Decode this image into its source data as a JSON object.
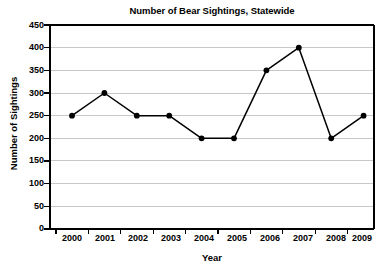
{
  "chart_data": {
    "type": "line",
    "title": "Number of Bear Sightings, Statewide",
    "xlabel": "Year",
    "ylabel": "Number of Sightings",
    "categories": [
      "2000",
      "2001",
      "2002",
      "2003",
      "2004",
      "2005",
      "2006",
      "2007",
      "2008",
      "2009"
    ],
    "values": [
      250,
      300,
      250,
      250,
      200,
      200,
      350,
      400,
      200,
      250
    ],
    "series": [
      {
        "name": "Bear Sightings",
        "values": [
          250,
          300,
          250,
          250,
          200,
          200,
          350,
          400,
          200,
          250
        ]
      }
    ],
    "points": [
      {
        "x": "2000",
        "y": 250
      },
      {
        "x": "2001",
        "y": 300
      },
      {
        "x": "2002",
        "y": 250
      },
      {
        "x": "2003",
        "y": 250
      },
      {
        "x": "2004",
        "y": 200
      },
      {
        "x": "2005",
        "y": 200
      },
      {
        "x": "2006",
        "y": 350
      },
      {
        "x": "2007",
        "y": 400
      },
      {
        "x": "2008",
        "y": 200
      },
      {
        "x": "2009",
        "y": 250
      }
    ],
    "ylim": [
      0,
      450
    ],
    "ytick_step": 50,
    "yticks": [
      0,
      50,
      100,
      150,
      200,
      250,
      300,
      350,
      400,
      450
    ],
    "ytick_labels": [
      "0",
      "50",
      "100",
      "150",
      "200",
      "250",
      "300",
      "350",
      "400",
      "450"
    ],
    "xtick_labels": [
      "2000",
      "2001",
      "2002",
      "2003",
      "2004",
      "2005",
      "2006",
      "2007",
      "2008",
      "2009"
    ],
    "grid": "horizontal",
    "legend": "none",
    "marker": "filled-circle",
    "line_color": "#000000",
    "marker_color": "#000000",
    "grid_color": "#c8c8c8",
    "axis_color": "#000000",
    "background_color": "#ffffff"
  }
}
